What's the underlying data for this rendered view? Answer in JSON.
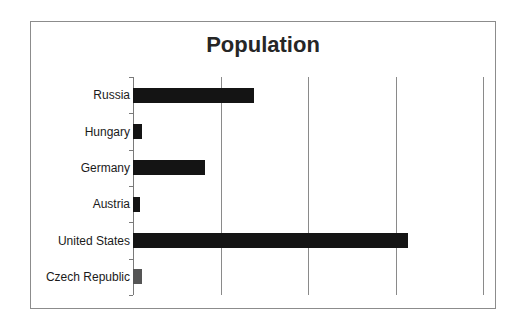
{
  "chart_data": {
    "type": "bar",
    "orientation": "horizontal",
    "title": "Population",
    "xlabel": "",
    "ylabel": "",
    "categories": [
      "Russia",
      "Hungary",
      "Germany",
      "Austria",
      "United States",
      "Czech Republic"
    ],
    "values": [
      138,
      10,
      82,
      8,
      314,
      10
    ],
    "bar_colors": [
      "#141414",
      "#141414",
      "#141414",
      "#141414",
      "#141414",
      "#555555"
    ],
    "xlim": [
      0,
      400
    ],
    "x_gridlines": [
      100,
      200,
      300,
      400
    ],
    "tick_labels_shown": false,
    "grid": true,
    "legend": null
  }
}
